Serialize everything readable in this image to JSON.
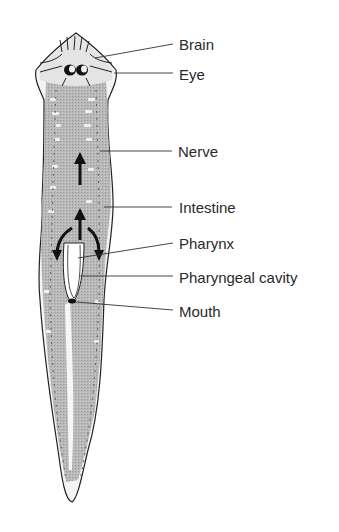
{
  "diagram": {
    "colors": {
      "outline": "#222222",
      "intestine_fill": "#b4b4b4",
      "head_fill": "#e2e2e2",
      "label_text": "#2a2a2a",
      "leader_line": "#333333"
    },
    "labels": [
      {
        "id": "brain",
        "text": "Brain",
        "x": 179,
        "y": 44
      },
      {
        "id": "eye",
        "text": "Eye",
        "x": 179,
        "y": 74
      },
      {
        "id": "nerve",
        "text": "Nerve",
        "x": 178,
        "y": 151
      },
      {
        "id": "intestine",
        "text": "Intestine",
        "x": 179,
        "y": 207
      },
      {
        "id": "pharynx",
        "text": "Pharynx",
        "x": 179,
        "y": 243
      },
      {
        "id": "pharyngeal-cavity",
        "text": "Pharyngeal cavity",
        "x": 179,
        "y": 277
      },
      {
        "id": "mouth",
        "text": "Mouth",
        "x": 179,
        "y": 311
      }
    ]
  }
}
